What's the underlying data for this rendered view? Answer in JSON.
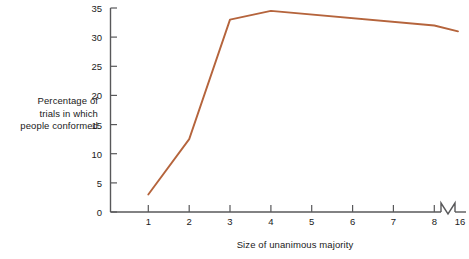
{
  "chart_data": {
    "type": "line",
    "title": "",
    "xlabel": "Size of unanimous majority",
    "ylabel": "Percentage of trials in which people conformed",
    "ylabel_lines": [
      "Percentage of",
      "trials in which",
      "people conformed"
    ],
    "x": [
      1,
      2,
      3,
      4,
      8,
      16
    ],
    "values": [
      3,
      12.5,
      33,
      34.5,
      32,
      31
    ],
    "categories": [
      "1",
      "2",
      "3",
      "4",
      "8",
      "16"
    ],
    "series": [
      {
        "name": "Percentage conformed",
        "values": [
          3,
          12.5,
          33,
          34.5,
          32,
          31
        ],
        "color": "#b5643c"
      }
    ],
    "xlim": [
      0,
      16
    ],
    "ylim": [
      0,
      35
    ],
    "ytick_labels": [
      "0",
      "5",
      "10",
      "15",
      "20",
      "25",
      "30",
      "35"
    ],
    "ytick_values": [
      0,
      5,
      10,
      15,
      20,
      25,
      30,
      35
    ],
    "xtick_labels": [
      "1",
      "2",
      "3",
      "4",
      "5",
      "6",
      "7",
      "8",
      "16"
    ],
    "xtick_values": [
      1,
      2,
      3,
      4,
      5,
      6,
      7,
      8,
      16
    ],
    "axis_break": {
      "present": true,
      "axis": "x",
      "between": [
        8,
        16
      ],
      "symbol": "zigzag"
    },
    "grid": false,
    "legend": {
      "visible": false,
      "position": "none"
    },
    "markers": false,
    "line_color": "#b5643c",
    "axis_color": "#58585a",
    "background": "#ffffff"
  }
}
